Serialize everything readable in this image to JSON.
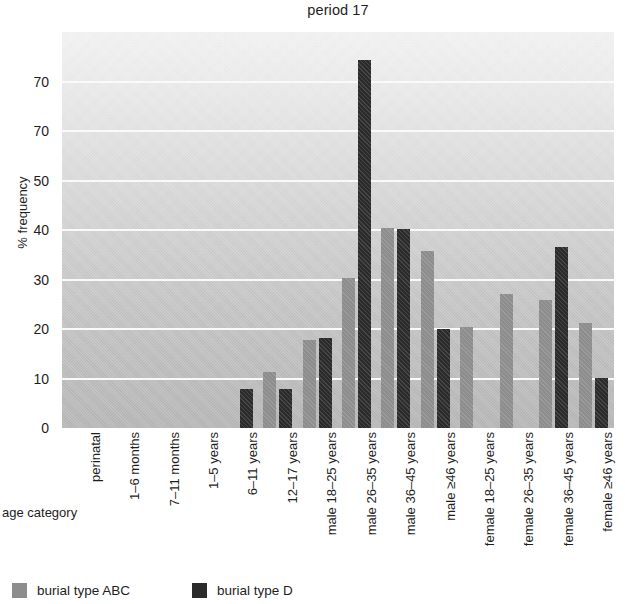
{
  "chart_data": {
    "type": "bar",
    "title": "period 17",
    "xlabel": "age category",
    "ylabel": "% frequency",
    "ylim": [
      0,
      80
    ],
    "grid": true,
    "legend_position": "bottom-left",
    "y_tick_labels": [
      "70",
      "70",
      "50",
      "40",
      "30",
      "20",
      "10",
      "0"
    ],
    "y_tick_values": [
      70,
      60,
      50,
      40,
      30,
      20,
      10,
      0
    ],
    "categories": [
      "perinatal",
      "1–6 months",
      "7–11 months",
      "1–5 years",
      "6–11 years",
      "12–17 years",
      "male 18–25 years",
      "male 26–35 years",
      "male 36–45 years",
      "male ≥46 years",
      "female 18–25 years",
      "female 26–35 years",
      "female 36–45 years",
      "female ≥46 years"
    ],
    "series": [
      {
        "name": "burial type ABC",
        "color": "#8d8d8d",
        "values": [
          0,
          0,
          0,
          0,
          0,
          11.3,
          17.8,
          30.3,
          40.5,
          35.8,
          20.5,
          27.1,
          25.8,
          21.2
        ]
      },
      {
        "name": "burial type D",
        "color": "#2b2b2b",
        "values": [
          0,
          0,
          0,
          0,
          7.8,
          7.8,
          18.2,
          74.3,
          40.2,
          20.1,
          0,
          0,
          36.5,
          10.1
        ]
      }
    ]
  },
  "legend": {
    "items": [
      {
        "label": "burial type ABC",
        "color": "#8d8d8d"
      },
      {
        "label": "burial type D",
        "color": "#2b2b2b"
      }
    ]
  }
}
